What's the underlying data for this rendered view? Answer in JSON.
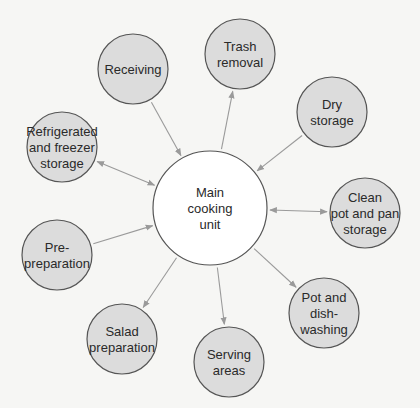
{
  "diagram": {
    "colors": {
      "background": "#f6f6f4",
      "node_fill": "#dcdcdc",
      "center_fill": "#ffffff",
      "stroke": "#555555",
      "edge": "#9a9a9a"
    },
    "center": {
      "id": "main",
      "lines": [
        "Main",
        "cooking",
        "unit"
      ],
      "cx": 210,
      "cy": 208,
      "r": 57
    },
    "nodes": [
      {
        "id": "receiving",
        "lines": [
          "Receiving"
        ],
        "cx": 133,
        "cy": 69,
        "r": 35,
        "direction": "to-center"
      },
      {
        "id": "trash",
        "lines": [
          "Trash",
          "removal"
        ],
        "cx": 240,
        "cy": 54,
        "r": 35,
        "direction": "from-center"
      },
      {
        "id": "dry",
        "lines": [
          "Dry",
          "storage"
        ],
        "cx": 332,
        "cy": 112,
        "r": 35,
        "direction": "to-center"
      },
      {
        "id": "clean-pot",
        "lines": [
          "Clean",
          "pot and pan",
          "storage"
        ],
        "cx": 365,
        "cy": 213,
        "r": 35,
        "direction": "both"
      },
      {
        "id": "pot-dish",
        "lines": [
          "Pot and",
          "dish-",
          "washing"
        ],
        "cx": 324,
        "cy": 313,
        "r": 35,
        "direction": "from-center"
      },
      {
        "id": "serving",
        "lines": [
          "Serving",
          "areas"
        ],
        "cx": 229,
        "cy": 362,
        "r": 35,
        "direction": "from-center"
      },
      {
        "id": "salad",
        "lines": [
          "Salad",
          "preparation"
        ],
        "cx": 122,
        "cy": 339,
        "r": 35,
        "direction": "from-center"
      },
      {
        "id": "pre-prep",
        "lines": [
          "Pre-",
          "preparation"
        ],
        "cx": 57,
        "cy": 255,
        "r": 35,
        "direction": "to-center"
      },
      {
        "id": "refrigerated",
        "lines": [
          "Refrigerated",
          "and freezer",
          "storage"
        ],
        "cx": 62,
        "cy": 147,
        "r": 35,
        "direction": "both"
      }
    ]
  }
}
